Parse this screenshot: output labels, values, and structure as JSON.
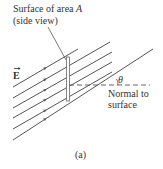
{
  "diagram": {
    "title_line1": "Surface of area ",
    "title_area_symbol": "A",
    "title_line2": "(side view)",
    "field_label": "E",
    "field_arrow": "⃗",
    "angle_label": "θ",
    "normal_label_line1": "Normal to",
    "normal_label_line2": "surface",
    "caption": "(a)",
    "colors": {
      "lines": "#555555",
      "surface": "#777777",
      "text": "#333333"
    },
    "field_lines": [
      {
        "x1": 13,
        "y1": 87,
        "x2": 78,
        "y2": 49
      },
      {
        "x1": 13,
        "y1": 98,
        "x2": 110,
        "y2": 42
      },
      {
        "x1": 13,
        "y1": 108,
        "x2": 112,
        "y2": 52
      },
      {
        "x1": 13,
        "y1": 118,
        "x2": 112,
        "y2": 62
      },
      {
        "x1": 13,
        "y1": 129,
        "x2": 112,
        "y2": 72
      },
      {
        "x1": 13,
        "y1": 140,
        "x2": 153,
        "y2": 49
      }
    ]
  }
}
